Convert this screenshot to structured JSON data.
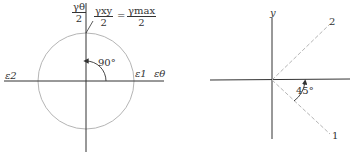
{
  "left_diagram": {
    "title": "Mohr's circle for strain (shear strain maximum)",
    "ordinate_fraction": {
      "num": "γθ",
      "den": "2"
    },
    "point_label_left": {
      "num": "γxy",
      "den": "2"
    },
    "equals": "=",
    "point_label_right": {
      "num": "γmax",
      "den": "2"
    },
    "angle_label": "90°",
    "axis_left_label": "ε2",
    "axis_right_labels": [
      "ε1",
      "εθ"
    ],
    "colors": {
      "axis": "#333333",
      "circle": "#b5b5b5"
    }
  },
  "right_diagram": {
    "title": "Principal directions",
    "y_axis_label": "y",
    "direction_2_label": "2",
    "direction_1_label": "1",
    "angle_label": "45°",
    "colors": {
      "axis": "#333333",
      "dashed": "#b5b5b5"
    }
  }
}
